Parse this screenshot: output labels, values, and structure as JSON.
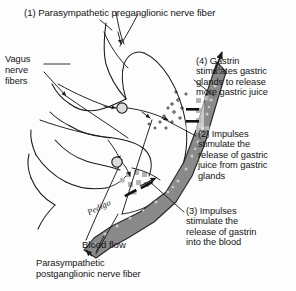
{
  "figure": {
    "title": "(1) Parasympathetic preganglionic nerve fiber",
    "background_color": "#fdfdfd",
    "line_color": "#1a1a1a",
    "vessel_fill": "#8a8a8a",
    "vessel_stroke": "#2a2a2a",
    "gland_cell_color": "#b4b4b4",
    "ganglion_fill": "#d8d8d8"
  },
  "labels": {
    "title": "(1) Parasympathetic preganglionic nerve fiber",
    "vagus": "Vagus\nnerve\nfibers",
    "gastrin": "(4) Gastrin\nstimulates gastric\nglands to release\nmore gastric juice",
    "impulses_gastric": "(2) Impulses\nstimulate the\nrelease of gastric\njuice from gastric\nglands",
    "impulses_gastrin": "(3) Impulses\nstimulate the\nrelease of gastrin\ninto the blood",
    "blood_flow": "Blood flow",
    "postganglionic": "Parasympathetic\npostganglionic nerve fiber",
    "signature": "Pedigo"
  },
  "icons": {
    "ganglion": "ganglion-circle-icon",
    "arrowhead": "nerve-arrowhead-icon",
    "gland_cell": "gastric-gland-cell-icon",
    "blood_vessel": "blood-vessel-icon",
    "stomach": "stomach-outline-icon",
    "secretion_dots": "gastric-juice-droplets-icon",
    "gastrin_bar": "gastrin-molecule-bar-icon"
  },
  "structures": {
    "stomach": "stomach",
    "vessel": "blood vessel",
    "ganglia_count": 2,
    "gland_clusters": 2
  }
}
